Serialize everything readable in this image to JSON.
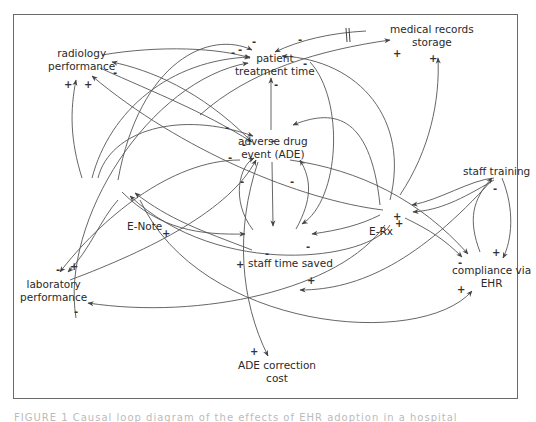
{
  "diagram": {
    "type": "causal-loop-diagram",
    "nodes": [
      {
        "id": "radiology",
        "label_line1": "radiology",
        "label_line2": "performance"
      },
      {
        "id": "patient_time",
        "label_line1": "patient",
        "label_line2": "treatment time"
      },
      {
        "id": "med_records",
        "label_line1": "medical records",
        "label_line2": "storage"
      },
      {
        "id": "ade",
        "label_line1": "adverse drug",
        "label_line2": "event (ADE)"
      },
      {
        "id": "staff_training",
        "label_line1": "staff training"
      },
      {
        "id": "enote",
        "label_line1": "E-Note"
      },
      {
        "id": "erx",
        "label_line1": "E-Rx"
      },
      {
        "id": "staff_time",
        "label_line1": "staff time saved"
      },
      {
        "id": "lab",
        "label_line1": "laboratory",
        "label_line2": "performance"
      },
      {
        "id": "compliance",
        "label_line1": "compliance via",
        "label_line2": "EHR"
      },
      {
        "id": "ade_cost",
        "label_line1": "ADE correction",
        "label_line2": "cost"
      }
    ],
    "polarities": {
      "p1": "-",
      "p2": "-",
      "p3": "-",
      "p4": "-",
      "p5": "-",
      "p6": "+",
      "p7": "+",
      "p8": "+",
      "p9": "+",
      "p10": "-",
      "p11": "-",
      "p12": "-",
      "p13": "-",
      "p14": "-",
      "p15": "-",
      "p16": "+",
      "p17": "-",
      "p18": "+",
      "p19": "-",
      "p20": "+",
      "p21": "+",
      "p22": "-",
      "p23": "+",
      "p24": "+",
      "p25": "-",
      "p26": "+",
      "p27": "-",
      "p28": "+",
      "p29": "-",
      "p30": "-",
      "p31": "+",
      "p32": "-"
    },
    "delay_mark": "||"
  },
  "caption": {
    "text": "FIGURE 1 Causal loop diagram of the effects of EHR adoption in a hospital"
  }
}
